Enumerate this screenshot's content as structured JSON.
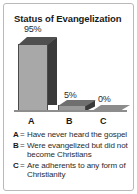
{
  "panel": {
    "title": "Status of Evangelization",
    "border_color": "#b9b9b9",
    "background": "#ffffff"
  },
  "chart_data": {
    "type": "bar",
    "title": "Status of Evangelization",
    "categories": [
      "A",
      "B",
      "C"
    ],
    "values": [
      95,
      5,
      0
    ],
    "value_labels": [
      "95%",
      "5%",
      "0%"
    ],
    "xlabel": "",
    "ylabel": "",
    "ylim": [
      0,
      100
    ],
    "grid": false,
    "legend_position": "below",
    "style": "3d-bar",
    "colors": {
      "bar_front": "#a8a8a8",
      "bar_side": "#3a3a3a",
      "bar_top": "#4f4f4f",
      "outline": "#4a4a4a",
      "baseline": "#8d8d8d"
    },
    "legend": [
      {
        "key": "A",
        "equals": "=",
        "text": "Have never heard the gospel"
      },
      {
        "key": "B",
        "equals": "=",
        "text": "Were evangelized but did not become Christians"
      },
      {
        "key": "C",
        "equals": "=",
        "text": "Are adherents to any form of Christianity"
      }
    ]
  }
}
